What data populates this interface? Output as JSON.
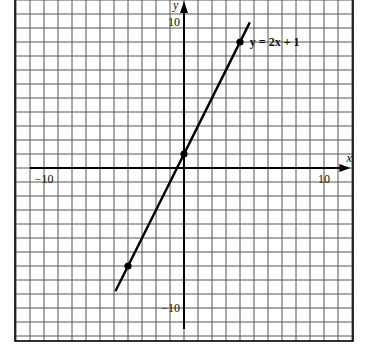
{
  "chart_data": {
    "type": "line",
    "title": "",
    "xlabel": "x",
    "ylabel": "y",
    "xlim": [
      -11.9,
      12.1
    ],
    "ylim": [
      -12.4,
      11.9
    ],
    "grid": true,
    "grid_step": 1,
    "x_ticks": [
      {
        "value": -10,
        "label": "−10"
      },
      {
        "value": 10,
        "label": "10"
      }
    ],
    "y_ticks": [
      {
        "value": 10,
        "label": "10"
      },
      {
        "value": -10,
        "label": "−10"
      }
    ],
    "series": [
      {
        "name": "y = 2x + 1",
        "equation": "y = 2x + 1",
        "x": [
          -4.9,
          4.7
        ],
        "y": [
          -8.8,
          10.4
        ],
        "points": [
          {
            "x": -4,
            "y": -7
          },
          {
            "x": 0,
            "y": 1
          },
          {
            "x": 4,
            "y": 9
          }
        ]
      }
    ],
    "legend": "inline label near line top-right",
    "annotations": [
      {
        "text": "y = 2x + 1",
        "x": 4.6,
        "y": 9
      }
    ]
  },
  "layout": {
    "origin_px": [
      184,
      168
    ],
    "unit_px": 14,
    "frame": {
      "left": 15,
      "top": 0,
      "right": 353,
      "bottom": 341
    },
    "colors": {
      "grid": "#555555",
      "axis": "#000000",
      "line": "#000000",
      "background": "#ffffff"
    }
  }
}
